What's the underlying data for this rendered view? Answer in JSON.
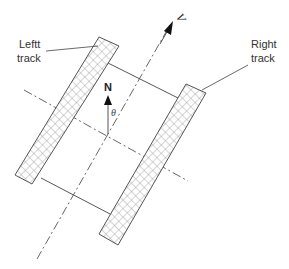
{
  "diagram": {
    "labels": {
      "left_track_line1": "Leftt",
      "left_track_line2": "track",
      "right_track_line1": "Right",
      "right_track_line2": "track",
      "velocity": "V",
      "north": "N",
      "angle": "θ"
    },
    "colors": {
      "stroke": "#555555",
      "hatch": "#888888",
      "text": "#333333",
      "background": "#ffffff"
    }
  }
}
